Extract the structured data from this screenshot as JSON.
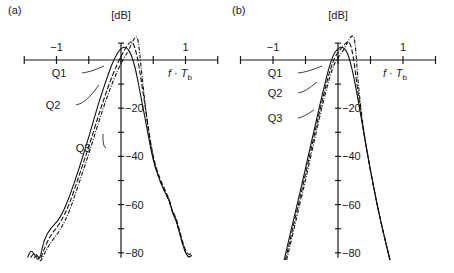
{
  "chart_data": [
    {
      "panel_label": "(a)",
      "type": "line",
      "ylabel": "[dB]",
      "xlabel": "f · T_b",
      "xlabel_main": "f · T",
      "xlabel_sub": "b",
      "xlim": [
        -1.5,
        1.5
      ],
      "ylim": [
        -80,
        0
      ],
      "x_ticks": [
        -1.5,
        -1,
        -0.5,
        0,
        0.5,
        1,
        1.5
      ],
      "x_tick_labels": [
        {
          "value": -1,
          "label": "−1"
        },
        {
          "value": 1,
          "label": "1"
        }
      ],
      "y_ticks": [
        -10,
        -20,
        -30,
        -40,
        -50,
        -60,
        -70,
        -80
      ],
      "y_tick_labels": [
        {
          "value": -20,
          "label": "−20"
        },
        {
          "value": -40,
          "label": "−40"
        },
        {
          "value": -60,
          "label": "−60"
        },
        {
          "value": -80,
          "label": "−80"
        }
      ],
      "series": [
        {
          "name": "Q1",
          "style": "solid",
          "x": [
            -1.45,
            -1.4,
            -1.35,
            -1.3,
            -1.25,
            -1.2,
            -1.1,
            -0.95,
            -0.8,
            -0.65,
            -0.5,
            -0.35,
            -0.2,
            -0.1,
            0.0,
            0.08,
            0.15,
            0.22,
            0.3,
            0.4,
            0.5,
            0.6,
            0.7,
            0.75,
            0.8,
            0.85,
            0.9,
            0.95,
            1.0,
            1.05,
            1.1
          ],
          "y": [
            -82,
            -79,
            -80,
            -83,
            -82,
            -75,
            -70,
            -66,
            -57,
            -45,
            -32,
            -18,
            -6,
            1,
            5,
            5.5,
            3,
            -3,
            -14,
            -28,
            -42,
            -50,
            -56,
            -58,
            -64,
            -66,
            -71,
            -76,
            -80,
            -82,
            -81
          ]
        },
        {
          "name": "Q2",
          "style": "dashed",
          "x": [
            -1.4,
            -1.35,
            -1.3,
            -1.25,
            -1.2,
            -1.1,
            -0.95,
            -0.8,
            -0.65,
            -0.5,
            -0.35,
            -0.2,
            -0.05,
            0.05,
            0.12,
            0.18,
            0.25,
            0.3,
            0.4,
            0.5,
            0.6,
            0.7,
            0.75,
            0.8,
            0.85,
            0.9,
            0.95,
            1.0,
            1.05,
            1.1
          ],
          "y": [
            -82,
            -80,
            -81,
            -83,
            -79,
            -73,
            -68,
            -60,
            -48,
            -36,
            -23,
            -11,
            -1,
            4,
            7,
            8,
            2,
            -6,
            -24,
            -41,
            -49,
            -55,
            -58,
            -63,
            -65,
            -70,
            -75,
            -79,
            -81,
            -80
          ]
        },
        {
          "name": "Q3",
          "style": "dash-dot",
          "x": [
            -1.35,
            -1.3,
            -1.25,
            -1.2,
            -1.1,
            -0.95,
            -0.8,
            -0.65,
            -0.5,
            -0.35,
            -0.2,
            -0.05,
            0.05,
            0.12,
            0.2,
            0.26,
            0.3,
            0.4,
            0.5,
            0.6,
            0.7,
            0.75,
            0.8,
            0.85,
            0.9,
            0.95,
            1.0,
            1.05,
            1.1
          ],
          "y": [
            -82,
            -81,
            -84,
            -81,
            -76,
            -71,
            -63,
            -51,
            -39,
            -26,
            -14,
            -4,
            1,
            4,
            9,
            10,
            0,
            -25,
            -42,
            -50,
            -56,
            -59,
            -63,
            -66,
            -71,
            -76,
            -80,
            -82,
            -81
          ]
        }
      ],
      "annotations": [
        "Q1",
        "Q2",
        "Q3"
      ]
    },
    {
      "panel_label": "(b)",
      "type": "line",
      "ylabel": "[dB]",
      "xlabel": "f · T_b",
      "xlabel_main": "f · T",
      "xlabel_sub": "b",
      "xlim": [
        -1.5,
        1.5
      ],
      "ylim": [
        -80,
        0
      ],
      "x_ticks": [
        -1.5,
        -1,
        -0.5,
        0,
        0.5,
        1,
        1.5
      ],
      "x_tick_labels": [
        {
          "value": -1,
          "label": "−1"
        },
        {
          "value": 1,
          "label": "1"
        }
      ],
      "y_ticks": [
        -10,
        -20,
        -30,
        -40,
        -50,
        -60,
        -70,
        -80
      ],
      "y_tick_labels": [
        {
          "value": -20,
          "label": "−20"
        },
        {
          "value": -40,
          "label": "−40"
        },
        {
          "value": -60,
          "label": "−60"
        },
        {
          "value": -80,
          "label": "−80"
        }
      ],
      "series": [
        {
          "name": "Q1",
          "style": "solid",
          "x": [
            -0.83,
            -0.7,
            -0.55,
            -0.4,
            -0.25,
            -0.1,
            0.0,
            0.08,
            0.15,
            0.22,
            0.3,
            0.4,
            0.5,
            0.6,
            0.7,
            0.8
          ],
          "y": [
            -83,
            -68,
            -51,
            -33,
            -15,
            1,
            5,
            5.5,
            3,
            -4,
            -15,
            -31,
            -46,
            -60,
            -72,
            -83
          ]
        },
        {
          "name": "Q2",
          "style": "dashed",
          "x": [
            -0.81,
            -0.68,
            -0.53,
            -0.38,
            -0.23,
            -0.08,
            0.05,
            0.12,
            0.17,
            0.23,
            0.3,
            0.4,
            0.5,
            0.6,
            0.7,
            0.8
          ],
          "y": [
            -83,
            -68,
            -51,
            -33,
            -15,
            0,
            5,
            7,
            8,
            3,
            -12,
            -31,
            -46,
            -60,
            -72,
            -83
          ]
        },
        {
          "name": "Q3",
          "style": "dash-dot",
          "x": [
            -0.79,
            -0.66,
            -0.51,
            -0.36,
            -0.21,
            -0.06,
            0.06,
            0.14,
            0.2,
            0.26,
            0.31,
            0.4,
            0.5,
            0.6,
            0.7,
            0.8
          ],
          "y": [
            -83,
            -68,
            -51,
            -33,
            -15,
            -1,
            3,
            7,
            10,
            10,
            -10,
            -31,
            -46,
            -60,
            -72,
            -83
          ]
        }
      ],
      "annotations": [
        "Q1",
        "Q2",
        "Q3"
      ]
    }
  ]
}
